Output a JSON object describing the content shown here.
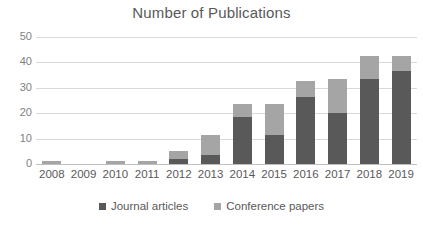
{
  "chart_data": {
    "type": "bar",
    "title": "Number of Publications",
    "xlabel": "",
    "ylabel": "",
    "ylim": [
      0,
      50
    ],
    "yticks": [
      0,
      10,
      20,
      30,
      40,
      50
    ],
    "ytick_labels": [
      "0",
      "10",
      "20",
      "30",
      "40",
      "50"
    ],
    "grid": true,
    "stacked": true,
    "legend_position": "bottom",
    "categories": [
      "2008",
      "2009",
      "2010",
      "2011",
      "2012",
      "2013",
      "2014",
      "2015",
      "2016",
      "2017",
      "2018",
      "2019"
    ],
    "series": [
      {
        "name": "Journal articles",
        "color": "#595959",
        "values": [
          0,
          0,
          0,
          0,
          2,
          3.5,
          18.5,
          11.5,
          26.5,
          20,
          33.5,
          36.5
        ]
      },
      {
        "name": "Conference papers",
        "color": "#a5a5a5",
        "values": [
          1,
          0,
          1,
          1,
          3,
          8,
          5,
          12,
          6,
          13.5,
          9,
          6
        ]
      }
    ],
    "totals": [
      1,
      0,
      1,
      1,
      5,
      11.5,
      23.5,
      23.5,
      32.5,
      33.5,
      42.5,
      42.5
    ]
  },
  "legend": {
    "items": [
      {
        "label": "Journal articles",
        "swatch_name": "legend-swatch-journal-articles"
      },
      {
        "label": "Conference papers",
        "swatch_name": "legend-swatch-conference-papers"
      }
    ]
  },
  "colors": {
    "journal_articles": "#595959",
    "conference_papers": "#a5a5a5",
    "gridline": "#d9d9d9",
    "axis": "#bfbfbf",
    "text": "#595959",
    "tick_text": "#7f7f7f",
    "background": "#ffffff"
  }
}
